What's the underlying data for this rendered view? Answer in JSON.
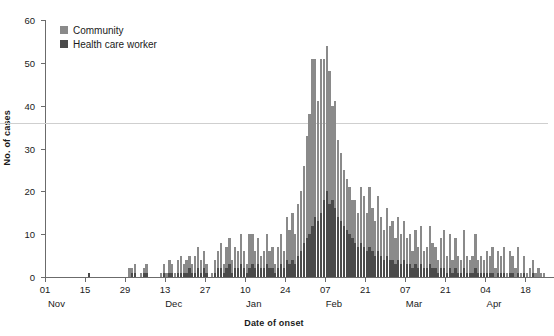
{
  "chart_data": {
    "type": "bar",
    "stacked": true,
    "title": "",
    "subtitle": "",
    "xlabel": "Date of onset",
    "ylabel": "No. of cases",
    "ylim": [
      0,
      60
    ],
    "yticks": [
      0,
      10,
      20,
      30,
      40,
      50,
      60
    ],
    "grid": false,
    "legend_position": "top-left-inside",
    "legend": [
      "Community",
      "Health care worker"
    ],
    "colors": {
      "community": "#8a8a8a",
      "health_care_worker": "#4a4a4a",
      "axis": "#6b6b6b",
      "text": "#1a1a1a",
      "artifact_line": "#cfcfcf"
    },
    "x_axis": {
      "start_date": "Nov 01",
      "tick_labels": [
        "01",
        "15",
        "29",
        "13",
        "27",
        "10",
        "24",
        "07",
        "21",
        "07",
        "21",
        "04",
        "18"
      ],
      "tick_day_indices": [
        0,
        14,
        28,
        42,
        56,
        70,
        84,
        98,
        112,
        126,
        140,
        154,
        168
      ],
      "month_labels": [
        {
          "label": "Nov",
          "day_index": 4
        },
        {
          "label": "Dec",
          "day_index": 45
        },
        {
          "label": "Jan",
          "day_index": 73
        },
        {
          "label": "Feb",
          "day_index": 101
        },
        {
          "label": "Mar",
          "day_index": 129
        },
        {
          "label": "Apr",
          "day_index": 157
        }
      ],
      "n_days": 176
    },
    "series": [
      {
        "name": "Health care worker",
        "values": [
          0,
          0,
          0,
          0,
          0,
          0,
          0,
          0,
          0,
          0,
          0,
          0,
          0,
          0,
          0,
          1,
          0,
          0,
          0,
          0,
          0,
          0,
          0,
          0,
          0,
          0,
          0,
          0,
          0,
          0,
          1,
          1,
          0,
          0,
          1,
          1,
          0,
          0,
          0,
          0,
          0,
          1,
          0,
          1,
          1,
          0,
          1,
          1,
          1,
          1,
          2,
          1,
          1,
          2,
          1,
          2,
          1,
          0,
          0,
          1,
          2,
          2,
          1,
          2,
          3,
          1,
          2,
          2,
          3,
          2,
          1,
          2,
          3,
          2,
          3,
          2,
          2,
          3,
          2,
          2,
          1,
          2,
          3,
          2,
          4,
          3,
          4,
          3,
          5,
          6,
          8,
          9,
          10,
          12,
          14,
          13,
          15,
          18,
          20,
          17,
          18,
          16,
          14,
          13,
          12,
          11,
          10,
          9,
          8,
          7,
          8,
          7,
          6,
          7,
          6,
          5,
          6,
          5,
          4,
          5,
          4,
          4,
          3,
          4,
          3,
          4,
          3,
          3,
          2,
          3,
          2,
          3,
          2,
          2,
          3,
          2,
          2,
          1,
          2,
          2,
          1,
          2,
          1,
          2,
          1,
          1,
          2,
          1,
          1,
          1,
          2,
          1,
          1,
          1,
          1,
          1,
          1,
          0,
          1,
          1,
          1,
          0,
          1,
          1,
          0,
          1,
          0,
          1,
          0,
          0,
          1,
          0,
          0,
          0,
          0,
          0
        ]
      },
      {
        "name": "Community",
        "values": [
          0,
          0,
          0,
          0,
          0,
          0,
          0,
          0,
          0,
          0,
          0,
          0,
          0,
          0,
          0,
          0,
          0,
          0,
          0,
          0,
          0,
          0,
          0,
          0,
          0,
          0,
          0,
          0,
          0,
          2,
          1,
          2,
          0,
          1,
          1,
          2,
          0,
          0,
          0,
          0,
          1,
          2,
          1,
          3,
          2,
          1,
          3,
          4,
          2,
          3,
          3,
          2,
          4,
          5,
          3,
          4,
          2,
          0,
          1,
          3,
          4,
          6,
          2,
          5,
          6,
          3,
          5,
          4,
          7,
          4,
          2,
          8,
          7,
          4,
          6,
          3,
          4,
          7,
          4,
          5,
          2,
          5,
          7,
          4,
          10,
          8,
          11,
          7,
          12,
          14,
          18,
          24,
          28,
          39,
          37,
          28,
          36,
          33,
          34,
          31,
          22,
          25,
          18,
          16,
          13,
          12,
          11,
          9,
          10,
          8,
          13,
          12,
          9,
          14,
          10,
          8,
          13,
          9,
          7,
          11,
          8,
          9,
          6,
          10,
          7,
          9,
          6,
          7,
          4,
          8,
          5,
          9,
          4,
          5,
          9,
          6,
          5,
          3,
          7,
          9,
          4,
          8,
          3,
          7,
          4,
          3,
          9,
          4,
          3,
          4,
          8,
          3,
          4,
          3,
          5,
          4,
          6,
          2,
          5,
          4,
          6,
          1,
          5,
          4,
          2,
          6,
          1,
          4,
          1,
          2,
          3,
          1,
          2,
          1,
          1,
          0
        ]
      }
    ],
    "peak": {
      "value": 54,
      "approx_date": "Feb 07"
    },
    "annotations": []
  }
}
